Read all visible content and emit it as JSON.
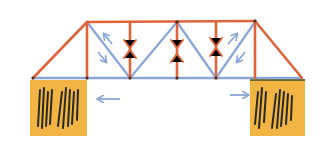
{
  "diagram": {
    "type": "truss-bridge",
    "colors": {
      "compression": "#e0643a",
      "tension": "#8aa6d8",
      "support_fill": "#f2b544",
      "support_hatch": "#2a2a1a",
      "joint": "#5a2a1a",
      "background": "#ffffff"
    },
    "members": {
      "top_chord": "compression",
      "end_posts": "compression",
      "verticals": "compression",
      "diagonals": "tension",
      "bottom_chord": "tension"
    },
    "annotations": [
      {
        "kind": "arrow-pair-outward",
        "location": "left-diagonal",
        "meaning": "tension"
      },
      {
        "kind": "arrow-pair-outward",
        "location": "right-diagonal",
        "meaning": "tension"
      },
      {
        "kind": "arrow-pair-inward",
        "location": "verticals",
        "meaning": "compression",
        "count": 3
      },
      {
        "kind": "arrow-left",
        "location": "below-left-bottom-chord"
      },
      {
        "kind": "arrow-right",
        "location": "below-right-bottom-chord"
      }
    ],
    "supports": [
      {
        "side": "left",
        "style": "hatched-abutment"
      },
      {
        "side": "right",
        "style": "hatched-abutment"
      }
    ]
  }
}
